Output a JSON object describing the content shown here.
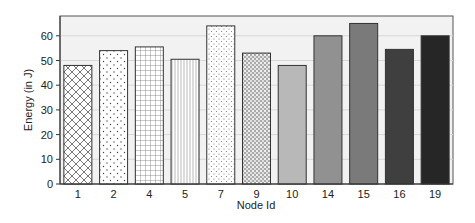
{
  "chart_data": {
    "type": "bar",
    "title": "",
    "xlabel": "Node Id",
    "ylabel": "Energy (in J)",
    "ylim": [
      0,
      68
    ],
    "yticks": [
      0,
      10,
      20,
      30,
      40,
      50,
      60
    ],
    "grid": "horizontal",
    "categories": [
      "1",
      "2",
      "4",
      "5",
      "7",
      "9",
      "10",
      "14",
      "15",
      "16",
      "19"
    ],
    "values": [
      48,
      54,
      55.5,
      50.5,
      64,
      53,
      48,
      60,
      65,
      54.5,
      60
    ],
    "bar_styles": [
      {
        "pattern": "crosshatch",
        "color": "#ffffff"
      },
      {
        "pattern": "sparse-dots",
        "color": "#ffffff"
      },
      {
        "pattern": "grid",
        "color": "#ffffff"
      },
      {
        "pattern": "vertical-lines",
        "color": "#ffffff"
      },
      {
        "pattern": "light-dots",
        "color": "#ffffff"
      },
      {
        "pattern": "dense-dots",
        "color": "#ffffff"
      },
      {
        "pattern": "solid",
        "color": "#b8b8b8"
      },
      {
        "pattern": "solid",
        "color": "#919191"
      },
      {
        "pattern": "solid",
        "color": "#7a7a7a"
      },
      {
        "pattern": "solid",
        "color": "#3f3f3f"
      },
      {
        "pattern": "solid",
        "color": "#262626"
      }
    ]
  },
  "labels": {
    "xlabel": "Node Id",
    "ylabel": "Energy (in J)"
  }
}
